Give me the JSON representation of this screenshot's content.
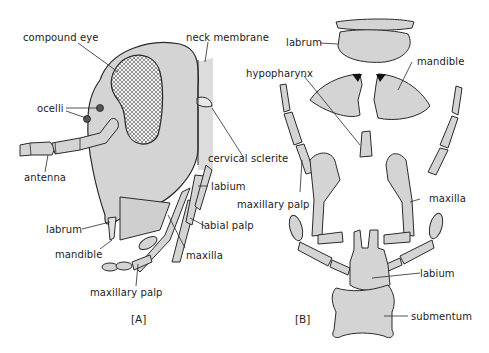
{
  "figure": {
    "panels": [
      {
        "id": "A",
        "caption": "[A]",
        "labels": {
          "compound_eye": "compound eye",
          "neck_membrane": "neck membrane",
          "ocelli": "ocelli",
          "antenna": "antenna",
          "cervical_sclerite": "cervical sclerite",
          "labium": "labium",
          "labrum": "labrum",
          "labial_palp": "labial palp",
          "mandible": "mandible",
          "maxilla": "maxilla",
          "maxillary_palp": "maxillary palp"
        }
      },
      {
        "id": "B",
        "caption": "[B]",
        "labels": {
          "labrum": "labrum",
          "mandible": "mandible",
          "hypopharynx": "hypopharynx",
          "maxillary_palp": "maxillary palp",
          "maxilla": "maxilla",
          "labium": "labium",
          "submentum": "submentum"
        }
      }
    ],
    "colors": {
      "fill": "#d4d4d4",
      "stroke": "#2a2a2a",
      "text": "#222222",
      "background": "#ffffff"
    }
  }
}
